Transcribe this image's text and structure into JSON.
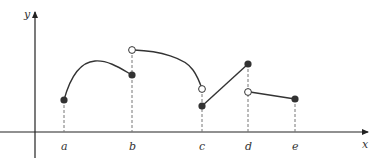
{
  "figure": {
    "type": "piecewise-function-graph",
    "axes": {
      "x_label": "x",
      "y_label": "y"
    },
    "ticks": [
      {
        "label": "a",
        "px": 64
      },
      {
        "label": "b",
        "px": 132
      },
      {
        "label": "c",
        "px": 202
      },
      {
        "label": "d",
        "px": 248
      },
      {
        "label": "e",
        "px": 295
      }
    ],
    "colors": {
      "curve": "#333333",
      "axis": "#222222",
      "filled_point": "#333333",
      "open_point_fill": "#ffffff",
      "guide_line": "#777777"
    },
    "points": [
      {
        "at": "a",
        "kind": "filled",
        "px": [
          64,
          100
        ]
      },
      {
        "at": "b",
        "kind": "filled",
        "px": [
          132,
          75
        ]
      },
      {
        "at": "b",
        "kind": "open",
        "px": [
          132,
          50
        ]
      },
      {
        "at": "c",
        "kind": "open",
        "px": [
          202,
          89
        ]
      },
      {
        "at": "c",
        "kind": "filled",
        "px": [
          202,
          106
        ]
      },
      {
        "at": "d",
        "kind": "filled",
        "px": [
          248,
          64
        ]
      },
      {
        "at": "d",
        "kind": "open",
        "px": [
          248,
          92
        ]
      },
      {
        "at": "e",
        "kind": "filled",
        "px": [
          295,
          99
        ]
      }
    ],
    "segments": [
      {
        "from": "a",
        "to": "b",
        "shape": "curve",
        "description": "rises from a to local max then decreases to filled point at b"
      },
      {
        "from": "b",
        "to": "c",
        "shape": "curve",
        "description": "starts at open circle above b, decreasing concave-down to open circle at c"
      },
      {
        "from": "c",
        "to": "d",
        "shape": "line",
        "description": "straight line from filled point at c up to filled point at d"
      },
      {
        "from": "d",
        "to": "e",
        "shape": "line",
        "description": "straight line from open circle at d slightly down to filled point at e"
      }
    ]
  }
}
